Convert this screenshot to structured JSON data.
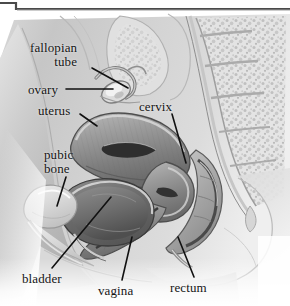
{
  "figure": {
    "style": "grayscale medical illustration",
    "width": 290,
    "height": 306,
    "background_color": "#ffffff",
    "ink_color": "#151515",
    "border": {
      "name": "top-frame-line",
      "color": "#4a4a4a",
      "description": "thin dark L-shaped rule across the top edge stepping down at the far left"
    }
  },
  "labels": [
    {
      "id": "fallopian-tube",
      "text_line_1": "fallopian",
      "text_line_2": "tube",
      "text": "fallopian tube",
      "x": 30,
      "y": 41,
      "align": "right",
      "leader": {
        "x1": 92,
        "y1": 68,
        "x2": 128,
        "y2": 88
      }
    },
    {
      "id": "ovary",
      "text_line_1": "ovary",
      "text_line_2": "",
      "text": "ovary",
      "x": 28,
      "y": 83,
      "align": "left",
      "leader": {
        "x1": 66,
        "y1": 89,
        "x2": 113,
        "y2": 89
      }
    },
    {
      "id": "uterus",
      "text_line_1": "uterus",
      "text_line_2": "",
      "text": "uterus",
      "x": 38,
      "y": 104,
      "align": "left",
      "leader": {
        "x1": 80,
        "y1": 114,
        "x2": 97,
        "y2": 126
      }
    },
    {
      "id": "cervix",
      "text_line_1": "cervix",
      "text_line_2": "",
      "text": "cervix",
      "x": 139,
      "y": 100,
      "align": "left",
      "leader": {
        "x1": 172,
        "y1": 114,
        "x2": 186,
        "y2": 163
      }
    },
    {
      "id": "pubic-bone",
      "text_line_1": "pubic",
      "text_line_2": "bone",
      "text": "pubic bone",
      "x": 44,
      "y": 148,
      "align": "left",
      "leader": {
        "x1": 66,
        "y1": 177,
        "x2": 57,
        "y2": 206
      }
    },
    {
      "id": "bladder",
      "text_line_1": "bladder",
      "text_line_2": "",
      "text": "bladder",
      "x": 22,
      "y": 272,
      "align": "left",
      "leader": {
        "x1": 52,
        "y1": 268,
        "x2": 111,
        "y2": 197
      }
    },
    {
      "id": "vagina",
      "text_line_1": "vagina",
      "text_line_2": "",
      "text": "vagina",
      "x": 98,
      "y": 284,
      "align": "left",
      "leader": {
        "x1": 122,
        "y1": 280,
        "x2": 132,
        "y2": 237
      }
    },
    {
      "id": "rectum",
      "text_line_1": "rectum",
      "text_line_2": "",
      "text": "rectum",
      "x": 170,
      "y": 281,
      "align": "left",
      "leader": {
        "x1": 194,
        "y1": 277,
        "x2": 178,
        "y2": 237
      }
    }
  ]
}
